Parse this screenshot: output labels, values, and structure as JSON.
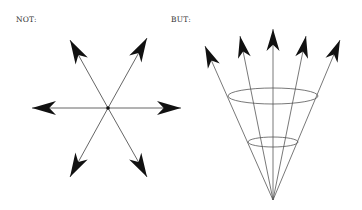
{
  "labels": {
    "left": "NOT:",
    "right": "BUT:"
  },
  "colors": {
    "line": "#555555",
    "arrowhead": "#111111",
    "background": "#ffffff"
  },
  "left_diagram": {
    "description": "Six arrows radiating outward from a single center point in all directions",
    "center": [
      108,
      108
    ],
    "arrows": [
      {
        "direction": "upper-left",
        "tip": [
          70,
          40
        ]
      },
      {
        "direction": "upper-right",
        "tip": [
          147,
          38
        ]
      },
      {
        "direction": "left",
        "tip": [
          32,
          108
        ]
      },
      {
        "direction": "right",
        "tip": [
          181,
          108
        ]
      },
      {
        "direction": "lower-left",
        "tip": [
          70,
          177
        ]
      },
      {
        "direction": "lower-right",
        "tip": [
          147,
          177
        ]
      }
    ]
  },
  "right_diagram": {
    "description": "Five arrows fanning upward from a single apex point, forming a cone with two elliptical cross-sections",
    "apex": [
      273,
      200
    ],
    "arrows": [
      {
        "tip": [
          205,
          46
        ]
      },
      {
        "tip": [
          240,
          36
        ]
      },
      {
        "tip": [
          273,
          29
        ]
      },
      {
        "tip": [
          306,
          36
        ]
      },
      {
        "tip": [
          340,
          40
        ]
      }
    ],
    "ellipses": [
      {
        "cx": 273,
        "cy": 96,
        "rx": 45,
        "ry": 8
      },
      {
        "cx": 273,
        "cy": 142,
        "rx": 25,
        "ry": 5
      }
    ]
  }
}
